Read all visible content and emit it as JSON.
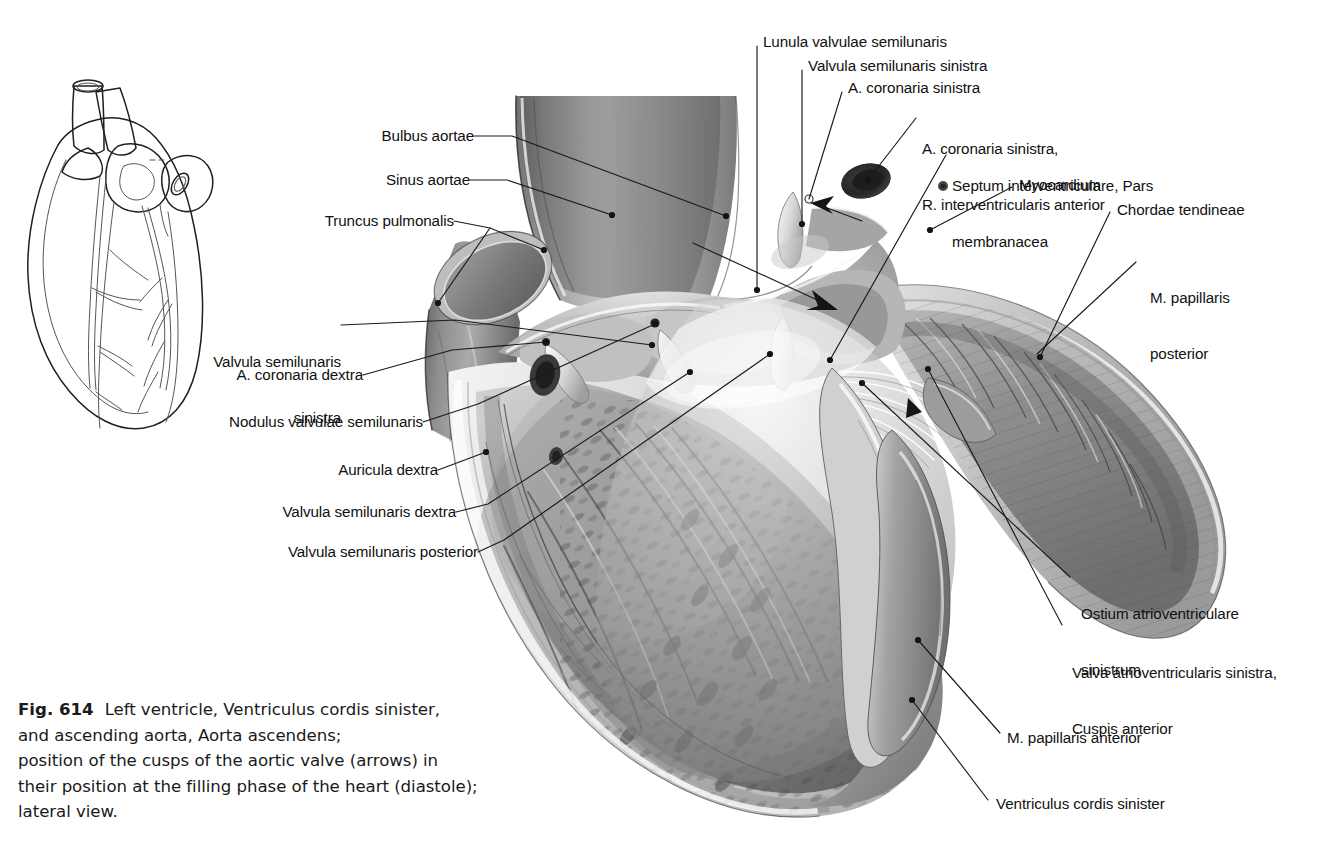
{
  "figure": {
    "number": "Fig. 614",
    "caption_lines": [
      "Left ventricle, Ventriculus cordis sinister,",
      "and ascending aorta, Aorta ascendens;",
      "position of the cusps of the aortic valve (arrows) in",
      "their position at the filling phase of the heart (diastole);",
      "lateral view."
    ]
  },
  "labels": {
    "left": [
      {
        "id": "bulbus-aortae",
        "text": "Bulbus aortae"
      },
      {
        "id": "sinus-aortae",
        "text": "Sinus aortae"
      },
      {
        "id": "truncus-pulmonalis",
        "text": "Truncus pulmonalis"
      },
      {
        "id": "valvula-semilunaris-sinistra",
        "line1": "Valvula semilunaris",
        "line2": "sinistra"
      },
      {
        "id": "a-coronaria-dextra",
        "text": "A. coronaria dextra"
      },
      {
        "id": "nodulus-valvulae-semilunaris",
        "text": "Nodulus valvulae semilunaris"
      },
      {
        "id": "auricula-dextra",
        "text": "Auricula dextra"
      },
      {
        "id": "valvula-semilunaris-dextra",
        "text": "Valvula semilunaris dextra"
      },
      {
        "id": "valvula-semilunaris-posterior",
        "text": "Valvula semilunaris posterior"
      }
    ],
    "top": [
      {
        "id": "lunula-valvulae-semilunaris",
        "text": "Lunula valvulae semilunaris"
      },
      {
        "id": "valvula-semilunaris-sinistra-top",
        "text": "Valvula semilunaris sinistra"
      },
      {
        "id": "a-coronaria-sinistra",
        "text": "A. coronaria sinistra"
      }
    ],
    "right": [
      {
        "id": "a-coronaria-sinistra-riva",
        "line1": "A. coronaria sinistra,",
        "line2": "R. interventricularis anterior"
      },
      {
        "id": "septum-interventriculare",
        "line1": "Septum interventriculare, Pars",
        "line2": "membranacea"
      },
      {
        "id": "myocardium",
        "text": "Myocardium"
      },
      {
        "id": "chordae-tendineae",
        "text": "Chordae tendineae"
      },
      {
        "id": "m-papillaris-posterior",
        "line1": "M. papillaris",
        "line2": "posterior"
      },
      {
        "id": "ostium-atrioventriculare-sinistrum",
        "line1": "Ostium atrioventriculare",
        "line2": "sinistrum"
      },
      {
        "id": "valva-atrioventricularis-sinistra",
        "line1": "Valva atrioventricularis sinistra,",
        "line2": "Cuspis anterior"
      },
      {
        "id": "m-papillaris-anterior",
        "text": "M. papillaris anterior"
      },
      {
        "id": "ventriculus-cordis-sinister",
        "text": "Ventriculus cordis sinister"
      }
    ]
  },
  "orientation_diagram": {
    "name": "heart-orientation-diagram",
    "description": "Line drawing of heart in anterior view"
  },
  "colors": {
    "background": "#ffffff",
    "text": "#111111",
    "leader": "#1a1a1a",
    "caption_text": "#1a1a1a"
  }
}
